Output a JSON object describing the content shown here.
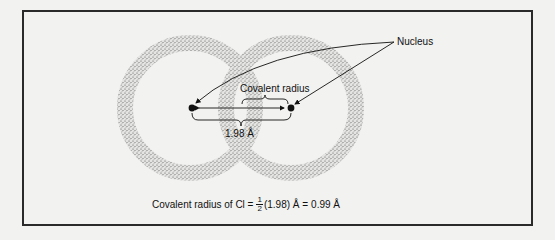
{
  "figure": {
    "labels": {
      "nucleus": "Nucleus",
      "covalent_radius": "Covalent radius",
      "bond_length": "1.98 Å"
    },
    "formula": {
      "prefix": "Covalent radius of Cl =",
      "fraction_numerator": "1",
      "fraction_denominator": "2",
      "middle": "(1.98) Å =",
      "result": "0.99 Å"
    },
    "colors": {
      "frame": "#2a2a2a",
      "stipple": "#555555",
      "background": "#f2f2f0",
      "ink": "#111111"
    }
  }
}
